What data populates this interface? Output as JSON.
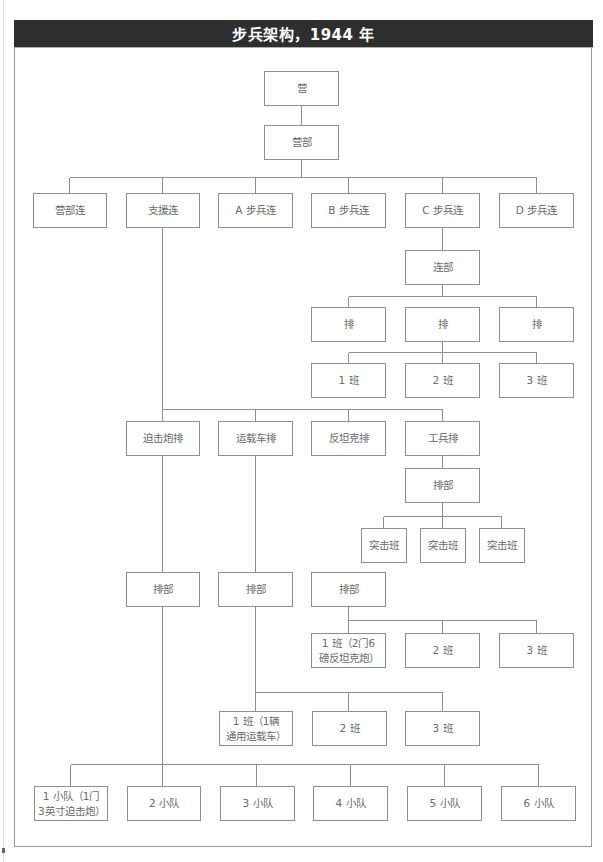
{
  "title": "步兵架构，1944 年",
  "colors": {
    "title_bar_bg": "#2e2e2e",
    "title_text": "#ffffff",
    "box_border": "#8e8e8e",
    "connector": "#8e8e8e",
    "box_text": "#6a6a6a"
  },
  "nodes": {
    "battalion": "营",
    "battalion_hq": "营部",
    "companies": [
      "营部连",
      "支援连",
      "A 步兵连",
      "B 步兵连",
      "C 步兵连",
      "D 步兵连"
    ],
    "company_hq": "连部",
    "platoons": [
      "排",
      "排",
      "排"
    ],
    "sections": [
      "1 班",
      "2 班",
      "3 班"
    ],
    "support_platoons": [
      "迫击炮排",
      "运载车排",
      "反坦克排",
      "工兵排"
    ],
    "pioneer_hq": "排部",
    "assault_sections": [
      "突击班",
      "突击班",
      "突击班"
    ],
    "platoon_hqs": [
      "排部",
      "排部",
      "排部"
    ],
    "antitank_sections": [
      "1 班（2门6\n磅反坦克炮）",
      "2 班",
      "3 班"
    ],
    "carrier_sections": [
      "1 班（1辆\n通用运载车）",
      "2 班",
      "3 班"
    ],
    "mortar_detachments": [
      "1 小队（1门\n3英寸迫击炮）",
      "2 小队",
      "3 小队",
      "4 小队",
      "5 小队",
      "6 小队"
    ]
  }
}
